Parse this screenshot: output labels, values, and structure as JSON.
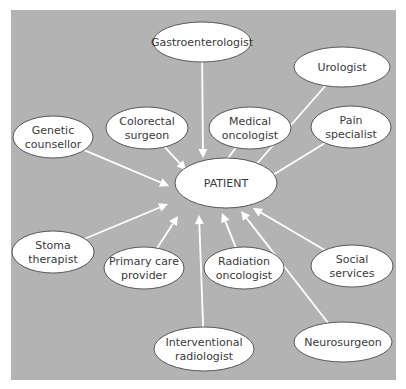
{
  "diagram": {
    "background_color": "#ffffff",
    "panel_color": "#b3b3b3",
    "panel": {
      "x": 11,
      "y": 10,
      "width": 385,
      "height": 370
    },
    "center_node": {
      "id": "patient",
      "label": "PATIENT",
      "lines": [
        "PATIENT"
      ],
      "cx": 226,
      "cy": 183,
      "rx": 51,
      "ry": 25
    },
    "nodes": [
      {
        "id": "gastroenterologist",
        "label": "Gastroenterologist",
        "lines": [
          "Gastroenterologist"
        ],
        "cx": 202,
        "cy": 42,
        "rx": 49,
        "ry": 20,
        "arrow_end": [
          203,
          158
        ]
      },
      {
        "id": "urologist",
        "label": "Urologist",
        "lines": [
          "Urologist"
        ],
        "cx": 342,
        "cy": 67,
        "rx": 48,
        "ry": 20,
        "arrow_end": [
          247,
          175
        ]
      },
      {
        "id": "colorectal-surgeon",
        "label": "Colorectal surgeon",
        "lines": [
          "Colorectal",
          "surgeon"
        ],
        "cx": 147,
        "cy": 128,
        "rx": 41,
        "ry": 21,
        "arrow_end": [
          186,
          170
        ]
      },
      {
        "id": "medical-oncologist",
        "label": "Medical oncologist",
        "lines": [
          "Medical",
          "oncologist"
        ],
        "cx": 250,
        "cy": 128,
        "rx": 41,
        "ry": 21,
        "arrow_end": [
          221,
          168
        ]
      },
      {
        "id": "pain-specialist",
        "label": "Pain specialist",
        "lines": [
          "Pain",
          "specialist"
        ],
        "cx": 351,
        "cy": 127,
        "rx": 40,
        "ry": 21,
        "arrow_end": [
          255,
          186
        ]
      },
      {
        "id": "genetic-counsellor",
        "label": "Genetic counsellor",
        "lines": [
          "Genetic",
          "counsellor"
        ],
        "cx": 53,
        "cy": 137,
        "rx": 40,
        "ry": 21,
        "arrow_end": [
          169,
          186
        ]
      },
      {
        "id": "stoma-therapist",
        "label": "Stoma therapist",
        "lines": [
          "Stoma",
          "therapist"
        ],
        "cx": 53,
        "cy": 252,
        "rx": 41,
        "ry": 21,
        "arrow_end": [
          168,
          204
        ]
      },
      {
        "id": "primary-care-provider",
        "label": "Primary care provider",
        "lines": [
          "Primary care",
          "provider"
        ],
        "cx": 144,
        "cy": 268,
        "rx": 40,
        "ry": 21,
        "arrow_end": [
          178,
          216
        ]
      },
      {
        "id": "radiation-oncologist",
        "label": "Radiation oncologist",
        "lines": [
          "Radiation",
          "oncologist"
        ],
        "cx": 244,
        "cy": 268,
        "rx": 40,
        "ry": 21,
        "arrow_end": [
          222,
          213
        ]
      },
      {
        "id": "social-services",
        "label": "Social services",
        "lines": [
          "Social",
          "services"
        ],
        "cx": 352,
        "cy": 266,
        "rx": 41,
        "ry": 21,
        "arrow_end": [
          253,
          208
        ]
      },
      {
        "id": "neurosurgeon",
        "label": "Neurosurgeon",
        "lines": [
          "Neurosurgeon"
        ],
        "cx": 343,
        "cy": 342,
        "rx": 49,
        "ry": 20,
        "arrow_end": [
          241,
          211
        ]
      },
      {
        "id": "interventional-radiologist",
        "label": "Interventional radiologist",
        "lines": [
          "Interventional",
          "radiologist"
        ],
        "cx": 204,
        "cy": 349,
        "rx": 50,
        "ry": 22,
        "arrow_end": [
          199,
          215
        ]
      }
    ],
    "arrow_color": "#ffffff",
    "arrow_direction": "toward-patient"
  }
}
